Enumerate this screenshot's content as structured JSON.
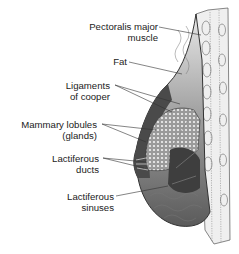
{
  "diagram": {
    "labels": [
      {
        "id": "pectoralis",
        "line1": "Pectoralis major",
        "line2": "muscle"
      },
      {
        "id": "fat",
        "line1": "Fat",
        "line2": ""
      },
      {
        "id": "ligaments",
        "line1": "Ligaments",
        "line2": "of cooper"
      },
      {
        "id": "lobules",
        "line1": "Mammary lobules",
        "line2": "(glands)"
      },
      {
        "id": "ducts",
        "line1": "Lactiferous",
        "line2": "ducts"
      },
      {
        "id": "sinuses",
        "line1": "Lactiferous",
        "line2": "sinuses"
      }
    ],
    "colors": {
      "outline": "#333333",
      "fat_light": "#d9d9d9",
      "fat_mid": "#a8a8a8",
      "dark_tissue": "#4a4a4a",
      "gland": "#bdbdbd",
      "muscle": "#ececec"
    }
  }
}
